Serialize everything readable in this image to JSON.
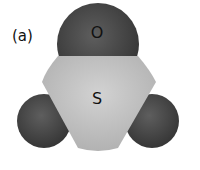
{
  "figure": {
    "panel_label": "(a)",
    "molecule": "SO3 space-filling model",
    "atoms": [
      {
        "id": "o-top",
        "label": "O",
        "color": "#4a4a4a"
      },
      {
        "id": "s-center",
        "label": "S",
        "color": "#c4c4c4"
      },
      {
        "id": "o-left",
        "label": "",
        "color": "#4a4a4a"
      },
      {
        "id": "o-right",
        "label": "",
        "color": "#4a4a4a"
      }
    ]
  }
}
